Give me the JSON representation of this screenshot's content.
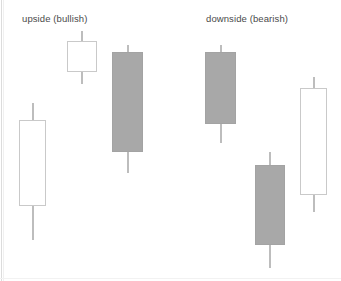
{
  "figure": {
    "title": "",
    "background_color": "#ffffff",
    "body_fill_bearish_color": "#a8a8a8",
    "body_fill_bullish_color": "#ffffff",
    "body_border_color": "#c9c9c9",
    "wick_color": "#7d7d7d",
    "label_color": "#4a4a4a"
  },
  "groups": [
    {
      "id": "bullish",
      "label": "upside (bullish)",
      "label_x": 22,
      "label_y": 13
    },
    {
      "id": "bearish",
      "label": "downside (bearish)",
      "label_x": 206,
      "label_y": 13
    }
  ],
  "chart_data": {
    "type": "candlestick",
    "title": "",
    "xlabel": "",
    "ylabel": "",
    "grid": false,
    "legend": "none",
    "annotations": [
      "upside (bullish)",
      "downside (bearish)"
    ],
    "series": [
      {
        "name": "upside (bullish)",
        "direction": "up",
        "candles": [
          {
            "index": 1,
            "group": "bullish",
            "color": "white",
            "type": "hollow",
            "x": 19,
            "width": 27,
            "body_top_y": 120,
            "body_bottom_y": 206,
            "wick_high_y": 103,
            "wick_low_y": 240
          },
          {
            "index": 2,
            "group": "bullish",
            "color": "white",
            "type": "hollow",
            "x": 67,
            "width": 30,
            "body_top_y": 41,
            "body_bottom_y": 72,
            "wick_high_y": 31,
            "wick_low_y": 84
          },
          {
            "index": 3,
            "group": "bullish",
            "color": "gray",
            "type": "filled",
            "x": 112,
            "width": 31,
            "body_top_y": 52,
            "body_bottom_y": 152,
            "wick_high_y": 45,
            "wick_low_y": 173
          }
        ]
      },
      {
        "name": "downside (bearish)",
        "direction": "down",
        "candles": [
          {
            "index": 4,
            "group": "bearish",
            "color": "gray",
            "type": "filled",
            "x": 205,
            "width": 31,
            "body_top_y": 52,
            "body_bottom_y": 124,
            "wick_high_y": 45,
            "wick_low_y": 143
          },
          {
            "index": 5,
            "group": "bearish",
            "color": "gray",
            "type": "filled",
            "x": 255,
            "width": 30,
            "body_top_y": 165,
            "body_bottom_y": 245,
            "wick_high_y": 152,
            "wick_low_y": 268
          },
          {
            "index": 6,
            "group": "bearish",
            "color": "white",
            "type": "hollow",
            "x": 300,
            "width": 27,
            "body_top_y": 88,
            "body_bottom_y": 195,
            "wick_high_y": 77,
            "wick_low_y": 212
          }
        ]
      }
    ]
  }
}
